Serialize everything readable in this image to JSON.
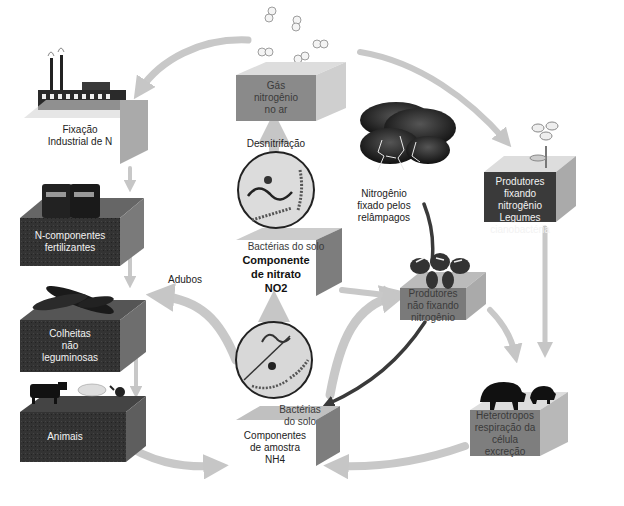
{
  "nodes": {
    "industrial": {
      "label_line1": "Fixação",
      "label_line2": "Industrial de N"
    },
    "fertilizer": {
      "label_line1": "N-componentes",
      "label_line2": "fertilizantes"
    },
    "crops": {
      "label_line1": "Colheitas",
      "label_line2": "não",
      "label_line3": "leguminosas"
    },
    "animals": {
      "label": "Animais"
    },
    "gas": {
      "label_line1": "Gás",
      "label_line2": "nitrogênio",
      "label_line3": "no ar"
    },
    "nitrate": {
      "bacteria": "Bactérias do solo",
      "label_line1": "Componente",
      "label_line2": "de nitrato",
      "label_line3": "NO2"
    },
    "ammonium": {
      "bacteria_line1": "Bactérias",
      "bacteria_line2": "do solo",
      "label_line1": "Componentes",
      "label_line2": "de amostra",
      "label_line3": "NH4"
    },
    "fixing_producers": {
      "label_line1": "Produtores fixando",
      "label_line2": "nitrogênio",
      "label_line3": "Legumes",
      "label_line4": "cianobactéria"
    },
    "non_fixing_producers": {
      "label_line1": "Produtores",
      "label_line2": "não fixando",
      "label_line3": "nitrogênio"
    },
    "heterotrophs": {
      "label_line1": "Heterotropos",
      "label_line2": "respiração da",
      "label_line3": "célula",
      "label_line4": "excreção"
    }
  },
  "process_labels": {
    "denitrification": "Desnitrifação",
    "lightning_line1": "Nitrogênio",
    "lightning_line2": "fixado pelos",
    "lightning_line3": "relâmpagos",
    "manure": "Adubos"
  },
  "colors": {
    "dark_box": "#2b2b2b",
    "mid_box": "#7d7d7d",
    "light_box": "#9a9a9a",
    "arrow_light": "#c8c8c8",
    "arrow_dark": "#3a3a3a"
  }
}
